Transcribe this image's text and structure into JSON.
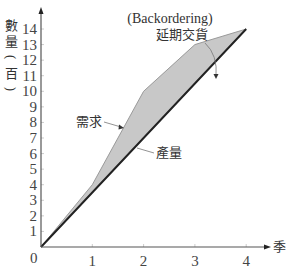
{
  "chart_data": {
    "type": "area",
    "title": "",
    "xlabel": "季",
    "ylabel": "數量（百）",
    "x": [
      0,
      1,
      2,
      3,
      4
    ],
    "xticks": [
      "0",
      "1",
      "2",
      "3",
      "4"
    ],
    "yticks": [
      "1",
      "2",
      "3",
      "4",
      "5",
      "6",
      "7",
      "8",
      "9",
      "10",
      "11",
      "12",
      "13",
      "14"
    ],
    "origin_label": "0",
    "xlim": [
      0,
      4.5
    ],
    "ylim": [
      0,
      14.5
    ],
    "grid": false,
    "legend": null,
    "series": [
      {
        "name": "需求",
        "values": [
          0,
          4,
          10,
          13,
          14
        ]
      },
      {
        "name": "產量",
        "values": [
          0,
          3.5,
          7,
          10.5,
          14
        ]
      }
    ],
    "shaded_region": {
      "between": [
        "需求",
        "產量"
      ],
      "label": "延期交貨",
      "label_en": "(Backordering)",
      "color": "#c8c8c8"
    },
    "annotations": [
      {
        "text": "(Backordering)",
        "role": "shaded-area-label-en"
      },
      {
        "text": "延期交貨",
        "role": "shaded-area-label"
      },
      {
        "text": "需求",
        "role": "demand-line-label"
      },
      {
        "text": "產量",
        "role": "production-line-label"
      }
    ]
  },
  "labels": {
    "y_axis_chars": [
      "數",
      "量",
      "（",
      "百",
      "）"
    ],
    "x_axis": "季",
    "backorder_en": "(Backordering)",
    "backorder_zh": "延期交貨",
    "demand": "需求",
    "production": "產量",
    "origin": "0"
  },
  "colors": {
    "axis": "#555555",
    "production_line": "#222222",
    "shaded_fill": "#c8c8c8",
    "shaded_edge": "#9a9a9a",
    "text": "#333333"
  }
}
